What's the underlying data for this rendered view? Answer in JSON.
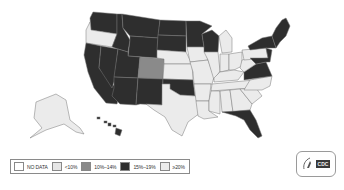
{
  "map": {
    "title": "",
    "colors": {
      "no_data": "#ffffff",
      "lt10": "#ebebeb",
      "10_14": "#8a8a8a",
      "15_19": "#2e2e2e",
      "gte20": "#ebebeb",
      "border": "#777777"
    },
    "states": {
      "WA": "15_19",
      "OR": "lt10",
      "CA": "15_19",
      "NV": "15_19",
      "ID": "15_19",
      "MT": "15_19",
      "WY": "15_19",
      "UT": "15_19",
      "AZ": "15_19",
      "CO": "10_14",
      "NM": "15_19",
      "ND": "15_19",
      "SD": "15_19",
      "NE": "lt10",
      "KS": "lt10",
      "OK": "15_19",
      "TX": "lt10",
      "MN": "15_19",
      "IA": "lt10",
      "MO": "lt10",
      "AR": "lt10",
      "LA": "lt10",
      "WI": "15_19",
      "IL": "lt10",
      "MI": "lt10",
      "IN": "lt10",
      "OH": "lt10",
      "KY": "lt10",
      "TN": "lt10",
      "MS": "lt10",
      "AL": "lt10",
      "GA": "lt10",
      "FL": "15_19",
      "SC": "lt10",
      "NC": "lt10",
      "VA": "15_19",
      "WV": "lt10",
      "PA": "lt10",
      "NY": "15_19",
      "VT": "15_19",
      "NH": "15_19",
      "ME": "15_19",
      "MA": "15_19",
      "CT": "15_19",
      "RI": "15_19",
      "NJ": "15_19",
      "DE": "15_19",
      "MD": "15_19",
      "AK": "lt10",
      "HI": "15_19"
    }
  },
  "legend": {
    "items": [
      {
        "key": "no_data",
        "label": "NO DATA",
        "color": "#ffffff"
      },
      {
        "key": "lt10",
        "label": "<10%",
        "color": "#e6e6e6"
      },
      {
        "key": "10_14",
        "label": "10%–14%",
        "color": "#8a8a8a"
      },
      {
        "key": "15_19",
        "label": "15%–19%",
        "color": "#2e2e2e"
      },
      {
        "key": "gte20",
        "label": "≥20%",
        "color": "#ececec"
      }
    ]
  },
  "logo": {
    "name": "CDC",
    "text": "CDC"
  }
}
